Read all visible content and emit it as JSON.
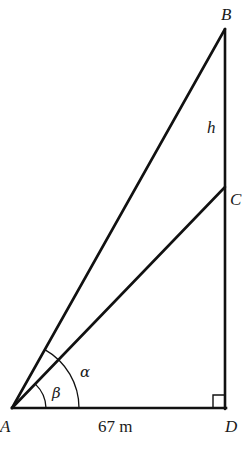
{
  "diagram": {
    "type": "right-triangle-angles-of-elevation",
    "stroke_color": "#111111",
    "points": {
      "A": {
        "label": "A",
        "x": 12,
        "y": 408
      },
      "B": {
        "label": "B",
        "x": 225,
        "y": 29
      },
      "C": {
        "label": "C",
        "x": 225,
        "y": 187
      },
      "D": {
        "label": "D",
        "x": 225,
        "y": 408
      }
    },
    "segments": [
      {
        "from": "A",
        "to": "B"
      },
      {
        "from": "A",
        "to": "C"
      },
      {
        "from": "A",
        "to": "D",
        "label": "67 m"
      },
      {
        "from": "D",
        "to": "B"
      }
    ],
    "labels": {
      "A": "A",
      "B": "B",
      "C": "C",
      "D": "D",
      "h": "h",
      "alpha": "α",
      "beta": "β",
      "base_length": "67 m"
    },
    "angles": {
      "alpha": {
        "symbol": "α",
        "vertex": "A",
        "between": [
          "AD",
          "AB"
        ]
      },
      "beta": {
        "symbol": "β",
        "vertex": "A",
        "between": [
          "AD",
          "AC"
        ]
      }
    },
    "right_angle_at": "D",
    "h_segment": "BC"
  }
}
